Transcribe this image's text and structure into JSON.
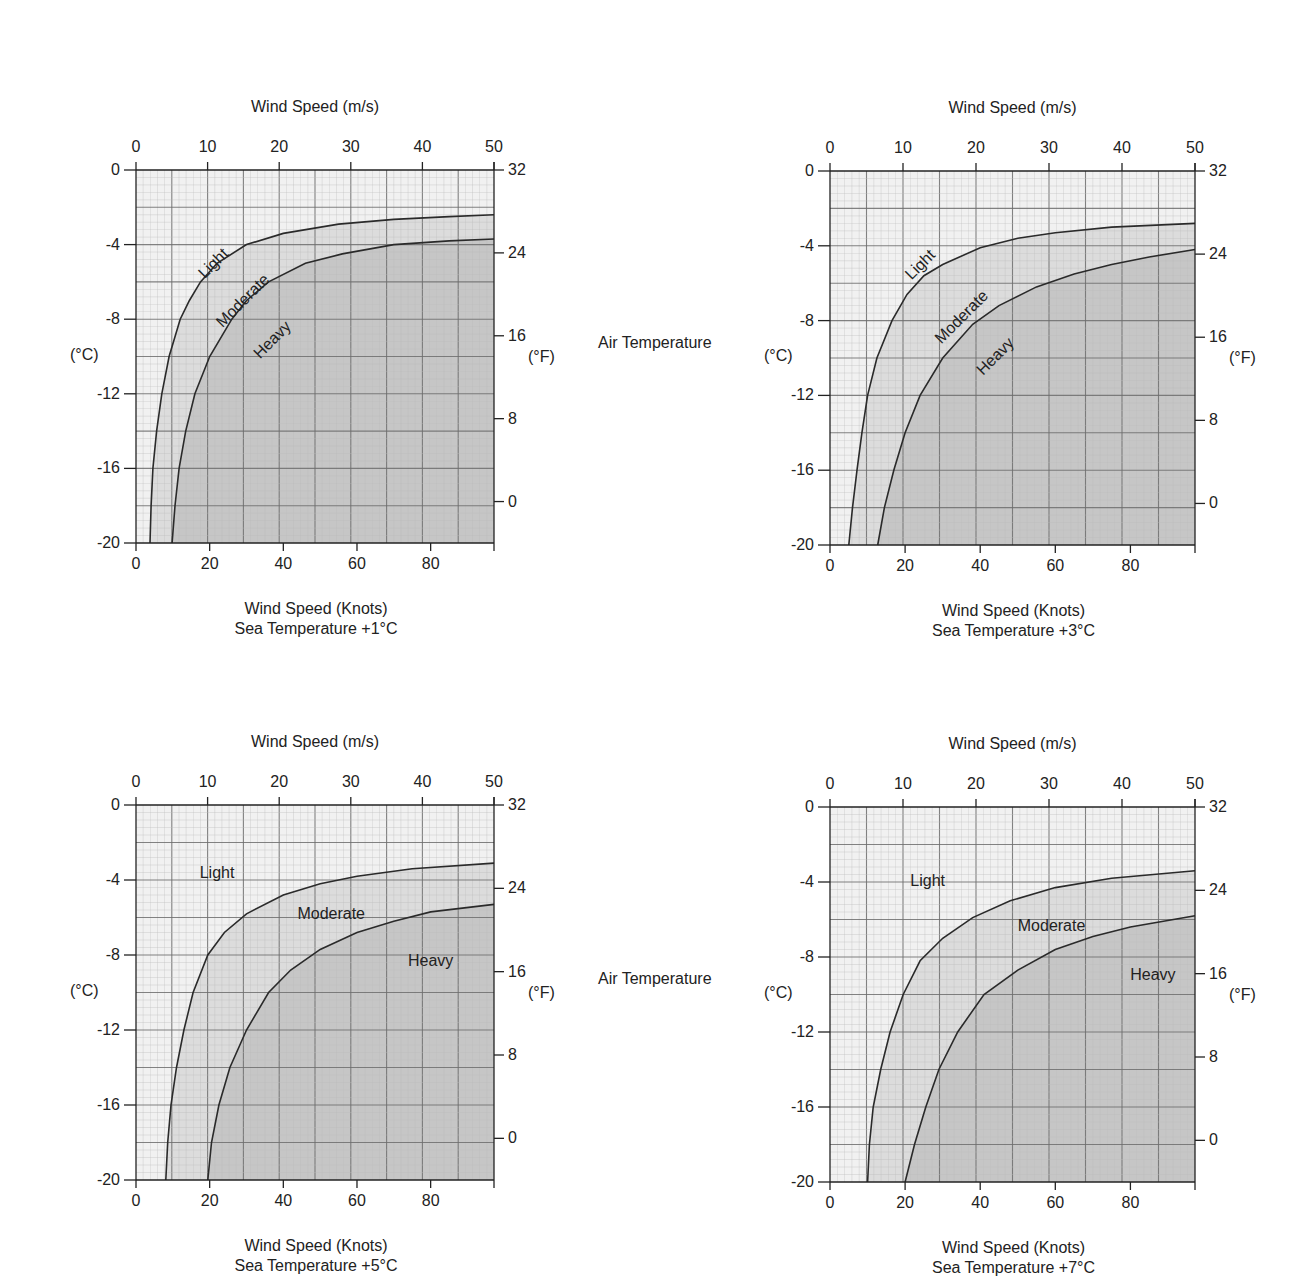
{
  "page": {
    "middle_labels": [
      "Air Temperature",
      "Air Temperature"
    ]
  },
  "colors": {
    "light_zone": "#f1f1f1",
    "moderate_zone": "#dcdcdc",
    "heavy_zone": "#c6c6c6",
    "grid_minor": "#bdbdbd",
    "grid_major": "#6e6e6e",
    "curve": "#2a2a2a"
  },
  "chart_data": [
    {
      "type": "area",
      "title": "Sea Temperature +1°C",
      "top_axis_label": "Wind Speed (m/s)",
      "xlabel": "Wind Speed (Knots)",
      "subtitle": "Sea Temperature +1°C",
      "ylabel_left": "(°C)",
      "ylabel_right": "(°F)",
      "top_ticks": [
        "0",
        "10",
        "20",
        "30",
        "40",
        "50"
      ],
      "bottom_ticks": [
        "0",
        "20",
        "40",
        "60",
        "80"
      ],
      "left_ticks": [
        "0",
        "-4",
        "-8",
        "-12",
        "-16",
        "-20"
      ],
      "right_ticks": [
        "32",
        "24",
        "16",
        "8",
        "0"
      ],
      "xlim_knots": [
        0,
        97.2
      ],
      "xlim_ms": [
        0,
        50
      ],
      "ylim_c": [
        -20,
        0
      ],
      "grid": true,
      "zone_labels": [
        {
          "text": "Light",
          "x_kt": 22,
          "y_c": -5.2,
          "rotate": -45
        },
        {
          "text": "Moderate",
          "x_kt": 30,
          "y_c": -7.2,
          "rotate": -45
        },
        {
          "text": "Heavy",
          "x_kt": 38,
          "y_c": -9.3,
          "rotate": -45
        }
      ],
      "series": [
        {
          "name": "Light/Moderate boundary",
          "points_kt_c": [
            [
              3.8,
              -20
            ],
            [
              4.1,
              -18
            ],
            [
              4.6,
              -16
            ],
            [
              5.6,
              -14
            ],
            [
              7.0,
              -12
            ],
            [
              9.0,
              -10
            ],
            [
              12.0,
              -8
            ],
            [
              14.5,
              -7
            ],
            [
              17.5,
              -6
            ],
            [
              22,
              -5
            ],
            [
              30,
              -4
            ],
            [
              40,
              -3.4
            ],
            [
              55,
              -2.9
            ],
            [
              70,
              -2.65
            ],
            [
              85,
              -2.5
            ],
            [
              97.2,
              -2.4
            ]
          ]
        },
        {
          "name": "Moderate/Heavy boundary",
          "points_kt_c": [
            [
              9.8,
              -20
            ],
            [
              10.6,
              -18
            ],
            [
              11.7,
              -16
            ],
            [
              13.5,
              -14
            ],
            [
              16.0,
              -12
            ],
            [
              20.0,
              -10
            ],
            [
              26,
              -8
            ],
            [
              30,
              -7
            ],
            [
              36,
              -6
            ],
            [
              46,
              -5
            ],
            [
              56,
              -4.5
            ],
            [
              70,
              -4.0
            ],
            [
              85,
              -3.8
            ],
            [
              97.2,
              -3.7
            ]
          ]
        }
      ]
    },
    {
      "type": "area",
      "title": "Sea Temperature +3°C",
      "top_axis_label": "Wind Speed (m/s)",
      "xlabel": "Wind Speed (Knots)",
      "subtitle": "Sea Temperature +3°C",
      "ylabel_left": "(°C)",
      "ylabel_right": "(°F)",
      "top_ticks": [
        "0",
        "10",
        "20",
        "30",
        "40",
        "50"
      ],
      "bottom_ticks": [
        "0",
        "20",
        "40",
        "60",
        "80"
      ],
      "left_ticks": [
        "0",
        "-4",
        "-8",
        "-12",
        "-16",
        "-20"
      ],
      "right_ticks": [
        "32",
        "24",
        "16",
        "8",
        "0"
      ],
      "xlim_knots": [
        0,
        97.2
      ],
      "xlim_ms": [
        0,
        50
      ],
      "ylim_c": [
        -20,
        0
      ],
      "grid": true,
      "zone_labels": [
        {
          "text": "Light",
          "x_kt": 25,
          "y_c": -5.2,
          "rotate": -45
        },
        {
          "text": "Moderate",
          "x_kt": 36,
          "y_c": -8.0,
          "rotate": -45
        },
        {
          "text": "Heavy",
          "x_kt": 45,
          "y_c": -10.1,
          "rotate": -45
        }
      ],
      "series": [
        {
          "name": "Light/Moderate boundary",
          "points_kt_c": [
            [
              5.0,
              -20
            ],
            [
              6.0,
              -18
            ],
            [
              7.2,
              -16
            ],
            [
              8.5,
              -14
            ],
            [
              10.0,
              -12
            ],
            [
              12.5,
              -10
            ],
            [
              16.5,
              -8
            ],
            [
              20.5,
              -6.6
            ],
            [
              25,
              -5.6
            ],
            [
              30,
              -5
            ],
            [
              40,
              -4.1
            ],
            [
              50,
              -3.6
            ],
            [
              60,
              -3.3
            ],
            [
              75,
              -3.0
            ],
            [
              97.2,
              -2.8
            ]
          ]
        },
        {
          "name": "Moderate/Heavy boundary",
          "points_kt_c": [
            [
              12.7,
              -20
            ],
            [
              14.5,
              -18
            ],
            [
              17,
              -16
            ],
            [
              20,
              -14
            ],
            [
              24,
              -12
            ],
            [
              30,
              -10
            ],
            [
              38,
              -8.2
            ],
            [
              45,
              -7.2
            ],
            [
              55,
              -6.2
            ],
            [
              65,
              -5.5
            ],
            [
              75,
              -5.0
            ],
            [
              85,
              -4.6
            ],
            [
              97.2,
              -4.2
            ]
          ]
        }
      ]
    },
    {
      "type": "area",
      "title": "Sea Temperature +5°C",
      "top_axis_label": "Wind Speed (m/s)",
      "xlabel": "Wind Speed (Knots)",
      "subtitle": "Sea Temperature +5°C",
      "ylabel_left": "(°C)",
      "ylabel_right": "(°F)",
      "top_ticks": [
        "0",
        "10",
        "20",
        "30",
        "40",
        "50"
      ],
      "bottom_ticks": [
        "0",
        "20",
        "40",
        "60",
        "80"
      ],
      "left_ticks": [
        "0",
        "-4",
        "-8",
        "-12",
        "-16",
        "-20"
      ],
      "right_ticks": [
        "32",
        "24",
        "16",
        "8",
        "0"
      ],
      "xlim_knots": [
        0,
        97.2
      ],
      "xlim_ms": [
        0,
        50
      ],
      "ylim_c": [
        -20,
        0
      ],
      "grid": true,
      "zone_labels": [
        {
          "text": "Light",
          "x_kt": 22,
          "y_c": -3.9,
          "rotate": 0
        },
        {
          "text": "Moderate",
          "x_kt": 53,
          "y_c": -6.1,
          "rotate": 0
        },
        {
          "text": "Heavy",
          "x_kt": 80,
          "y_c": -8.6,
          "rotate": 0
        }
      ],
      "series": [
        {
          "name": "Light/Moderate boundary",
          "points_kt_c": [
            [
              8.1,
              -20
            ],
            [
              8.6,
              -18
            ],
            [
              9.5,
              -16
            ],
            [
              11,
              -14
            ],
            [
              13,
              -12
            ],
            [
              15.5,
              -10
            ],
            [
              19.5,
              -8
            ],
            [
              24,
              -6.8
            ],
            [
              30,
              -5.8
            ],
            [
              40,
              -4.8
            ],
            [
              50,
              -4.2
            ],
            [
              60,
              -3.8
            ],
            [
              75,
              -3.4
            ],
            [
              97.2,
              -3.1
            ]
          ]
        },
        {
          "name": "Moderate/Heavy boundary",
          "points_kt_c": [
            [
              19.5,
              -20
            ],
            [
              20.5,
              -18
            ],
            [
              22.5,
              -16
            ],
            [
              25.5,
              -14
            ],
            [
              30,
              -12
            ],
            [
              36,
              -10
            ],
            [
              42,
              -8.8
            ],
            [
              50,
              -7.7
            ],
            [
              60,
              -6.8
            ],
            [
              70,
              -6.2
            ],
            [
              80,
              -5.7
            ],
            [
              97.2,
              -5.3
            ]
          ]
        }
      ]
    },
    {
      "type": "area",
      "title": "Sea Temperature +7°C",
      "top_axis_label": "Wind Speed (m/s)",
      "xlabel": "Wind Speed (Knots)",
      "subtitle": "Sea Temperature +7°C",
      "ylabel_left": "(°C)",
      "ylabel_right": "(°F)",
      "top_ticks": [
        "0",
        "10",
        "20",
        "30",
        "40",
        "50"
      ],
      "bottom_ticks": [
        "0",
        "20",
        "40",
        "60",
        "80"
      ],
      "left_ticks": [
        "0",
        "-4",
        "-8",
        "-12",
        "-16",
        "-20"
      ],
      "right_ticks": [
        "32",
        "24",
        "16",
        "8",
        "0"
      ],
      "xlim_knots": [
        0,
        97.2
      ],
      "xlim_ms": [
        0,
        50
      ],
      "ylim_c": [
        -20,
        0
      ],
      "grid": true,
      "zone_labels": [
        {
          "text": "Light",
          "x_kt": 26,
          "y_c": -4.2,
          "rotate": 0
        },
        {
          "text": "Moderate",
          "x_kt": 59,
          "y_c": -6.6,
          "rotate": 0
        },
        {
          "text": "Heavy",
          "x_kt": 86,
          "y_c": -9.2,
          "rotate": 0
        }
      ],
      "series": [
        {
          "name": "Light/Moderate boundary",
          "points_kt_c": [
            [
              10,
              -20
            ],
            [
              10.5,
              -18
            ],
            [
              11.5,
              -16
            ],
            [
              13.5,
              -14
            ],
            [
              16,
              -12
            ],
            [
              19.5,
              -10
            ],
            [
              24,
              -8.2
            ],
            [
              30,
              -7
            ],
            [
              38,
              -5.9
            ],
            [
              48,
              -5
            ],
            [
              60,
              -4.3
            ],
            [
              75,
              -3.8
            ],
            [
              97.2,
              -3.4
            ]
          ]
        },
        {
          "name": "Moderate/Heavy boundary",
          "points_kt_c": [
            [
              20,
              -20
            ],
            [
              22.5,
              -18
            ],
            [
              25.5,
              -16
            ],
            [
              29,
              -14
            ],
            [
              34,
              -12
            ],
            [
              41,
              -10
            ],
            [
              50,
              -8.7
            ],
            [
              60,
              -7.6
            ],
            [
              70,
              -6.9
            ],
            [
              80,
              -6.4
            ],
            [
              97.2,
              -5.8
            ]
          ]
        }
      ]
    }
  ]
}
